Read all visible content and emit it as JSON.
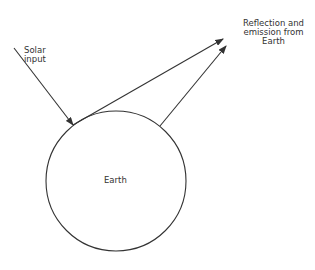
{
  "diagram": {
    "labels": {
      "solar_line1": "Solar",
      "solar_line2": "input",
      "reflection_line1": "Reflection and",
      "reflection_line2": "emission from",
      "reflection_line3": "Earth",
      "earth": "Earth"
    },
    "colors": {
      "stroke": "#333333",
      "background": "#ffffff"
    }
  }
}
